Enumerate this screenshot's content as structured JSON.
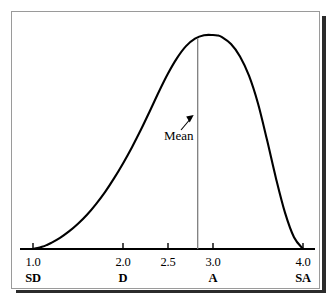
{
  "figure": {
    "frame_color": "#9a9a9a",
    "ink_color": "#000000",
    "background": "#ffffff",
    "mean_line_color": "#7a7a7a"
  },
  "annotations": {
    "mean_label": "Mean"
  },
  "chart_data": {
    "type": "line",
    "title": "",
    "subtitle": "",
    "xlabel": "",
    "ylabel": "",
    "grid": false,
    "legend": false,
    "xlim": [
      1.0,
      4.0
    ],
    "ylim": [
      0,
      1
    ],
    "axis": {
      "x_ticks": [
        1.0,
        2.0,
        2.5,
        3.0,
        4.0
      ],
      "x_tick_labels": [
        "1.0",
        "2.0",
        "2.5",
        "3.0",
        "4.0"
      ],
      "x_category_labels": [
        "SD",
        "D",
        "",
        "A",
        "SA"
      ],
      "y_ticks": [],
      "y_tick_labels": []
    },
    "annotations": [
      {
        "text": "Mean",
        "x": 2.83,
        "kind": "vertical-line-with-arrow",
        "line_from_y": 0,
        "line_to_y": 0.985
      }
    ],
    "series": [
      {
        "name": "distribution",
        "description": "negatively skewed (left-tailed) unimodal density curve",
        "x": [
          1.0,
          1.05,
          1.1,
          1.15,
          1.2,
          1.3,
          1.4,
          1.5,
          1.6,
          1.7,
          1.8,
          1.9,
          2.0,
          2.1,
          2.2,
          2.3,
          2.4,
          2.5,
          2.6,
          2.7,
          2.8,
          2.9,
          3.0,
          3.05,
          3.1,
          3.2,
          3.3,
          3.4,
          3.5,
          3.6,
          3.7,
          3.8,
          3.9,
          4.0
        ],
        "y": [
          0.0,
          0.004,
          0.01,
          0.018,
          0.028,
          0.052,
          0.082,
          0.118,
          0.16,
          0.21,
          0.266,
          0.33,
          0.4,
          0.476,
          0.558,
          0.646,
          0.736,
          0.82,
          0.892,
          0.948,
          0.983,
          0.999,
          1.0,
          0.998,
          0.99,
          0.958,
          0.9,
          0.81,
          0.68,
          0.51,
          0.33,
          0.17,
          0.055,
          0.0
        ]
      }
    ]
  }
}
